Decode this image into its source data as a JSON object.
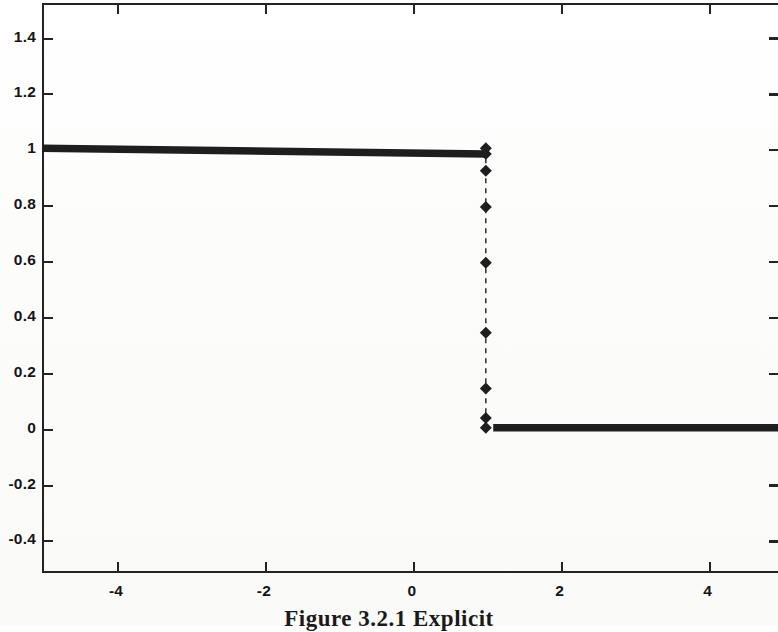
{
  "caption": "Figure 3.2.1 Explicit",
  "axis": {
    "y_ticks": [
      "1.4",
      "1.2",
      "1",
      "0.8",
      "0.6",
      "0.4",
      "0.2",
      "0",
      "-0.2",
      "-0.4"
    ],
    "y_tick_values": [
      1.4,
      1.2,
      1.0,
      0.8,
      0.6,
      0.4,
      0.2,
      0.0,
      -0.2,
      -0.4
    ],
    "x_ticks": [
      "-4",
      "-2",
      "0",
      "2",
      "4"
    ],
    "x_tick_values": [
      -4,
      -2,
      0,
      2,
      4
    ]
  },
  "colors": {
    "line": "#1e1e1e",
    "axis": "#232323",
    "text": "#151515",
    "background": "#fdfdfc"
  },
  "chart_data": {
    "type": "line",
    "title": "",
    "subtitle": "",
    "xlabel": "",
    "ylabel": "",
    "xlim": [
      -5.0,
      4.95
    ],
    "ylim": [
      -0.52,
      1.52
    ],
    "grid": false,
    "legend": null,
    "legend_position": "none",
    "annotations": [],
    "series": [
      {
        "name": "solution",
        "marker": "diamond",
        "linestyle": "dashed",
        "linewidth": 1.4,
        "markersize": 5,
        "x": [
          -5.0,
          -4.9,
          -4.8,
          -4.7,
          -4.6,
          -4.5,
          -4.4,
          -4.3,
          -4.2,
          -4.1,
          -4.0,
          -3.9,
          -3.8,
          -3.7,
          -3.6,
          -3.5,
          -3.4,
          -3.3,
          -3.2,
          -3.1,
          -3.0,
          -2.9,
          -2.8,
          -2.7,
          -2.6,
          -2.5,
          -2.4,
          -2.3,
          -2.2,
          -2.1,
          -2.0,
          -1.9,
          -1.8,
          -1.7,
          -1.6,
          -1.5,
          -1.4,
          -1.3,
          -1.2,
          -1.1,
          -1.0,
          -0.9,
          -0.8,
          -0.7,
          -0.6,
          -0.5,
          -0.4,
          -0.3,
          -0.2,
          -0.1,
          0.0,
          0.1,
          0.2,
          0.3,
          0.4,
          0.5,
          0.6,
          0.7,
          0.8,
          0.9,
          0.95,
          1.0,
          1.0,
          1.0,
          1.0,
          1.0,
          1.0,
          1.0,
          1.05,
          1.1,
          1.2,
          1.3,
          1.4,
          1.5,
          1.6,
          1.7,
          1.8,
          1.9,
          2.0,
          2.1,
          2.2,
          2.3,
          2.4,
          2.5,
          2.6,
          2.7,
          2.8,
          2.9,
          3.0,
          3.1,
          3.2,
          3.3,
          3.4,
          3.5,
          3.6,
          3.7,
          3.8,
          3.9,
          4.0,
          4.1,
          4.2,
          4.3,
          4.4,
          4.5,
          4.6,
          4.7,
          4.8,
          4.9,
          4.95
        ],
        "y": [
          1.0,
          1.0,
          1.0,
          1.0,
          1.0,
          1.0,
          1.0,
          1.0,
          1.0,
          1.0,
          1.0,
          1.0,
          1.0,
          1.0,
          1.0,
          1.0,
          1.0,
          1.0,
          1.0,
          1.0,
          1.0,
          1.0,
          1.0,
          1.0,
          1.0,
          1.0,
          1.0,
          1.0,
          1.0,
          1.0,
          1.0,
          1.0,
          1.0,
          1.0,
          1.0,
          1.0,
          1.0,
          1.0,
          1.0,
          1.0,
          1.0,
          1.0,
          1.0,
          1.0,
          1.0,
          1.0,
          1.0,
          1.0,
          1.0,
          1.0,
          1.0,
          1.0,
          1.0,
          1.0,
          1.0,
          1.0,
          1.0,
          1.0,
          1.0,
          1.0,
          0.99,
          0.98,
          0.92,
          0.79,
          0.59,
          0.34,
          0.14,
          0.035,
          0.01,
          0.0,
          0.0,
          0.0,
          0.0,
          0.0,
          0.0,
          0.0,
          0.0,
          0.0,
          0.0,
          0.0,
          0.0,
          0.0,
          0.0,
          0.0,
          0.0,
          0.0,
          0.0,
          0.0,
          0.0,
          0.0,
          0.0,
          0.0,
          0.0,
          0.0,
          0.0,
          0.0,
          0.0,
          0.0,
          0.0,
          0.0,
          0.0,
          0.0,
          0.0,
          0.0,
          0.0,
          0.0,
          0.0,
          0.0,
          0.0
        ],
        "transition_markers": [
          {
            "x": 1.0,
            "y": 0.98
          },
          {
            "x": 1.0,
            "y": 0.92
          },
          {
            "x": 1.0,
            "y": 0.79
          },
          {
            "x": 1.0,
            "y": 0.59
          },
          {
            "x": 1.0,
            "y": 0.34
          },
          {
            "x": 1.0,
            "y": 0.14
          },
          {
            "x": 1.0,
            "y": 0.035
          }
        ]
      }
    ]
  }
}
